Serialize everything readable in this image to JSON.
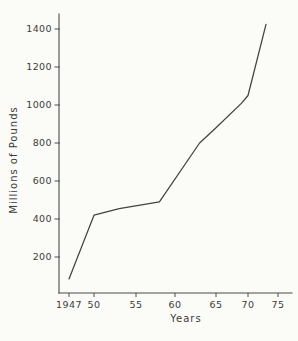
{
  "figure": {
    "background": "#fbfbf8",
    "ink_color": "#424242"
  },
  "chart_data": {
    "type": "line",
    "title": "",
    "xlabel": "Years",
    "ylabel": "Millions of Pounds",
    "xlim": [
      1947,
      1975
    ],
    "ylim": [
      0,
      1480
    ],
    "grid": false,
    "legend": false,
    "x_ticks": [
      {
        "value": 1947,
        "label": "1947"
      },
      {
        "value": 1950,
        "label": "50"
      },
      {
        "value": 1955,
        "label": "55"
      },
      {
        "value": 1960,
        "label": "60"
      },
      {
        "value": 1965,
        "label": "65"
      },
      {
        "value": 1970,
        "label": "70"
      },
      {
        "value": 1975,
        "label": "75"
      }
    ],
    "y_ticks": [
      {
        "value": 200,
        "label": "200"
      },
      {
        "value": 400,
        "label": "400"
      },
      {
        "value": 600,
        "label": "600"
      },
      {
        "value": 800,
        "label": "800"
      },
      {
        "value": 1000,
        "label": "1000"
      },
      {
        "value": 1200,
        "label": "1200"
      },
      {
        "value": 1400,
        "label": "1400"
      }
    ],
    "series": [
      {
        "name": "millions-of-pounds",
        "points": [
          [
            1947,
            85
          ],
          [
            1950,
            420
          ],
          [
            1953,
            455
          ],
          [
            1958,
            490
          ],
          [
            1963,
            800
          ],
          [
            1965,
            880
          ],
          [
            1969,
            1010
          ],
          [
            1970,
            1050
          ],
          [
            1973,
            1425
          ]
        ]
      }
    ]
  }
}
